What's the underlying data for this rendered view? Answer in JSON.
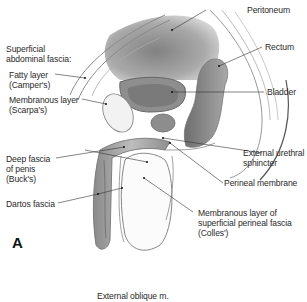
{
  "figure": {
    "panel_label": "A",
    "labels": {
      "superficial_abdominal_fascia": [
        "Superficial",
        "abdominal fascia:"
      ],
      "fatty_layer": [
        "Fatty layer",
        "(Camper's)"
      ],
      "membranous_layer": [
        "Membranous layer",
        "(Scarpa's)"
      ],
      "deep_fascia_penis": [
        "Deep fascia",
        "of penis",
        "(Buck's)"
      ],
      "dartos_fascia": [
        "Dartos fascia"
      ],
      "peritoneum": [
        "Peritoneum"
      ],
      "rectum": [
        "Rectum"
      ],
      "bladder": [
        "Bladder"
      ],
      "external_urethral_sphincter": [
        "External urethral",
        "sphincter"
      ],
      "perineal_membrane": [
        "Perineal membrane"
      ],
      "colles_fascia": [
        "Membranous layer of",
        "superficial perineal fascia",
        "(Colles')"
      ],
      "external_oblique": [
        "External oblique m."
      ]
    }
  }
}
